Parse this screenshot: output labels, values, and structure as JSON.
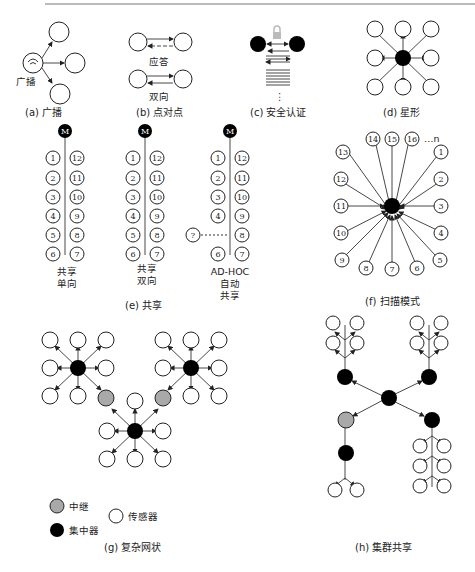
{
  "figure": {
    "panels": [
      {
        "id": "a",
        "caption": "(a) 广播",
        "labels": [
          "广播"
        ]
      },
      {
        "id": "b",
        "caption": "(b) 点对点",
        "labels": [
          "应答",
          "双向"
        ]
      },
      {
        "id": "c",
        "caption": "(c) 安全认证",
        "labels": [
          "⋮"
        ]
      },
      {
        "id": "d",
        "caption": "(d) 星形",
        "labels": []
      },
      {
        "id": "e",
        "caption": "(e) 共享",
        "hub_label": "M",
        "left_nodes": [
          "1",
          "2",
          "3",
          "4",
          "5",
          "6"
        ],
        "right_nodes": [
          "12",
          "11",
          "10",
          "9",
          "8",
          "7"
        ],
        "unknown_node": "?",
        "columns": [
          {
            "label_line1": "共享",
            "label_line2": "单向",
            "label_line3": ""
          },
          {
            "label_line1": "共享",
            "label_line2": "双向",
            "label_line3": ""
          },
          {
            "label_line1": "AD-HOC",
            "label_line2": "自动",
            "label_line3": "共享"
          }
        ]
      },
      {
        "id": "f",
        "caption": "(f) 扫描模式",
        "nodes": [
          "14",
          "15",
          "16",
          "13",
          "1",
          "12",
          "2",
          "11",
          "3",
          "10",
          "4",
          "9",
          "5",
          "8",
          "7",
          "6"
        ],
        "ellipsis": "…n"
      },
      {
        "id": "g",
        "caption": "(g) 复杂网状",
        "legend": [
          {
            "label": "中继",
            "color": "#a9a9a9"
          },
          {
            "label": "集中器",
            "color": "#000000"
          },
          {
            "label": "传感器",
            "color": "#ffffff"
          }
        ]
      },
      {
        "id": "h",
        "caption": "(h) 集群共享"
      }
    ]
  },
  "colors": {
    "hub": "#000000",
    "relay": "#a9a9a9",
    "sensor": "#ffffff",
    "line": "#333333"
  }
}
